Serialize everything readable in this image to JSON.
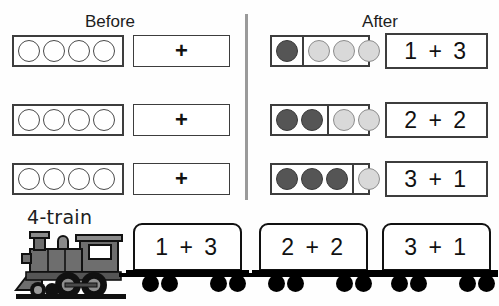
{
  "page": {
    "top_cut_text": "",
    "divider": "vertical-separator"
  },
  "headings": {
    "before": "Before",
    "after": "After"
  },
  "colors": {
    "dark_counter": "#555555",
    "light_counter": "#d9d9d9",
    "empty_counter": "#ffffff",
    "outline": "#3d3d3d",
    "divider": "#9a9a9a",
    "train_black": "#000000",
    "loco_gray": "#808080"
  },
  "before_rows": [
    {
      "counters": [
        "empty",
        "empty",
        "empty",
        "empty"
      ],
      "operator": "+"
    },
    {
      "counters": [
        "empty",
        "empty",
        "empty",
        "empty"
      ],
      "operator": "+"
    },
    {
      "counters": [
        "empty",
        "empty",
        "empty",
        "empty"
      ],
      "operator": "+"
    }
  ],
  "after_rows": [
    {
      "left_counters": [
        "dark"
      ],
      "right_counters": [
        "light",
        "light",
        "light"
      ],
      "equation": "1 + 3"
    },
    {
      "left_counters": [
        "dark",
        "dark"
      ],
      "right_counters": [
        "light",
        "light"
      ],
      "equation": "2 + 2"
    },
    {
      "left_counters": [
        "dark",
        "dark",
        "dark"
      ],
      "right_counters": [
        "light"
      ],
      "equation": "3 + 1"
    }
  ],
  "train": {
    "label": "4-train",
    "locomotive": "steam-locomotive",
    "cars": [
      {
        "equation": "1 + 3"
      },
      {
        "equation": "2 + 2"
      },
      {
        "equation": "3 + 1"
      }
    ]
  }
}
